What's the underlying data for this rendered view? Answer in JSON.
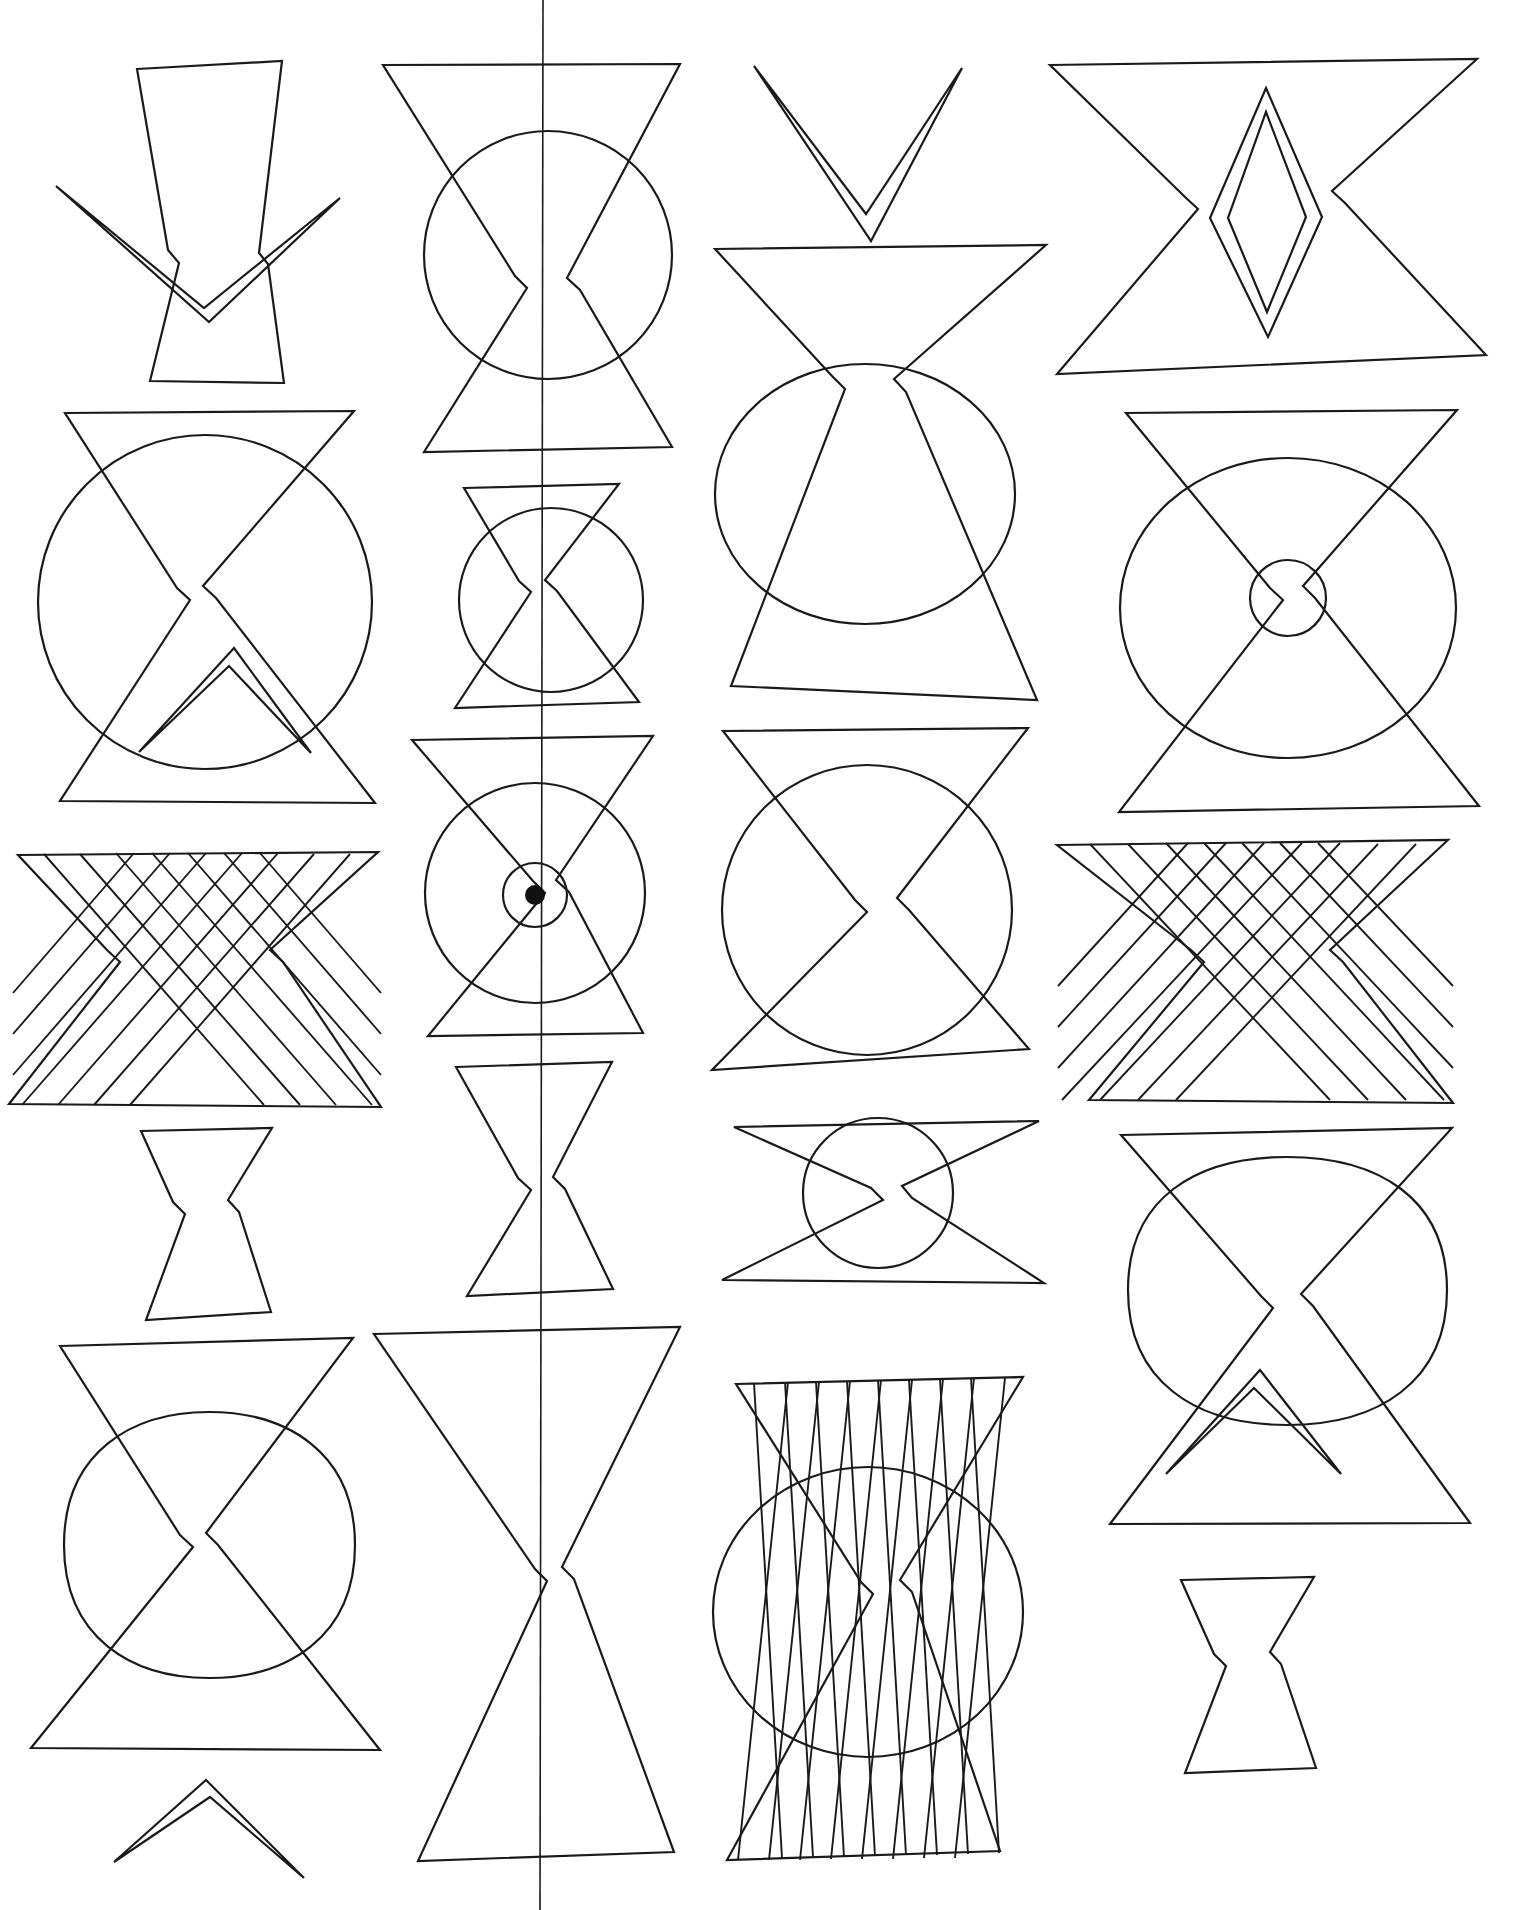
{
  "document": {
    "title": "Geometric Figure Plate",
    "kind": "line-drawing-plate",
    "background_color": "#ffffff",
    "ink_color": "#1a1a1a",
    "width": 1519,
    "height": 1910,
    "grid": {
      "columns": 4,
      "rows": 5
    },
    "has_center_fold_line": true
  },
  "fold_line": {
    "name": "center-vertical-fold",
    "x": 543,
    "y_start": 0,
    "y_end": 1910,
    "color": "#1a1a1a"
  },
  "figures": [
    {
      "id": "r1c1",
      "name": "bowtie-with-wide-chevron",
      "row": 1,
      "column": 1,
      "elements": [
        "bowtie",
        "chevron"
      ],
      "label": "Bowtie crossed by wide open chevron"
    },
    {
      "id": "r1c2",
      "name": "large-bowtie-with-circle",
      "row": 1,
      "column": 2,
      "elements": [
        "bowtie",
        "circle"
      ],
      "label": "Large bowtie overlapping a circle"
    },
    {
      "id": "r1c3a",
      "name": "narrow-chevron",
      "row": 1,
      "column": 3,
      "elements": [
        "chevron"
      ],
      "label": "Narrow V chevron"
    },
    {
      "id": "r1c3b",
      "name": "wide-bowtie-with-ellipse",
      "row": 1,
      "column": 3,
      "elements": [
        "bowtie",
        "ellipse"
      ],
      "label": "Wide bowtie overlapping an ellipse"
    },
    {
      "id": "r1c4",
      "name": "bowtie-with-lens-diamond",
      "row": 1,
      "column": 4,
      "elements": [
        "bowtie",
        "diamond-outline",
        "diamond-inner"
      ],
      "label": "Bowtie containing nested elongated diamond"
    },
    {
      "id": "r2c1",
      "name": "bowtie-circle-with-inner-triangle",
      "row": 2,
      "column": 1,
      "elements": [
        "bowtie",
        "circle",
        "triangle-spike"
      ],
      "label": "Bowtie over circle with spiked inner triangle"
    },
    {
      "id": "r2c2",
      "name": "small-bowtie-with-circle",
      "row": 2,
      "column": 2,
      "elements": [
        "bowtie",
        "circle"
      ],
      "label": "Small bowtie overlapping a circle"
    },
    {
      "id": "r2c4",
      "name": "bowtie-ellipse-with-tiny-circle",
      "row": 2,
      "column": 4,
      "elements": [
        "bowtie",
        "ellipse",
        "small-circle"
      ],
      "label": "Bowtie over ellipse with small circle at waist"
    },
    {
      "id": "r3c1",
      "name": "striped-bowtie-left",
      "row": 3,
      "column": 1,
      "elements": [
        "bowtie",
        "hatching"
      ],
      "stripe_count": 7,
      "label": "Bowtie filled with crossing diagonal stripes"
    },
    {
      "id": "r3c2",
      "name": "bowtie-with-bullseye",
      "row": 3,
      "column": 2,
      "elements": [
        "bowtie",
        "circle",
        "inner-circle",
        "center-dot"
      ],
      "label": "Bowtie with concentric bullseye and center dot"
    },
    {
      "id": "r3c3",
      "name": "bowtie-with-circle-mid",
      "row": 3,
      "column": 3,
      "elements": [
        "bowtie",
        "circle"
      ],
      "label": "Bowtie overlapping a circle"
    },
    {
      "id": "r3c4",
      "name": "striped-bowtie-right",
      "row": 3,
      "column": 4,
      "elements": [
        "bowtie",
        "hatching"
      ],
      "stripe_count": 7,
      "label": "Bowtie filled with crossing diagonal stripes"
    },
    {
      "id": "r4c1",
      "name": "small-plain-bowtie",
      "row": 4,
      "column": 1,
      "elements": [
        "bowtie"
      ],
      "label": "Small plain bowtie"
    },
    {
      "id": "r4c2",
      "name": "tall-narrow-bowtie",
      "row": 4,
      "column": 2,
      "elements": [
        "bowtie"
      ],
      "label": "Tall narrow bowtie"
    },
    {
      "id": "r4c3",
      "name": "flat-bowtie-with-circle",
      "row": 4,
      "column": 3,
      "elements": [
        "bowtie",
        "circle"
      ],
      "label": "Flat wide bowtie with circle at waist"
    },
    {
      "id": "r4c4",
      "name": "bowtie-rounded-square-spike",
      "row": 4,
      "column": 4,
      "elements": [
        "bowtie",
        "rounded-square",
        "triangle-spike"
      ],
      "label": "Bowtie over rounded square with spiked inner triangle"
    },
    {
      "id": "r5c1",
      "name": "bowtie-with-rounded-square",
      "row": 5,
      "column": 1,
      "elements": [
        "bowtie",
        "rounded-square"
      ],
      "label": "Bowtie overlapping a rounded square"
    },
    {
      "id": "r5c1b",
      "name": "small-chevron",
      "row": 5,
      "column": 1,
      "elements": [
        "chevron"
      ],
      "label": "Small chevron at page foot"
    },
    {
      "id": "r5c2",
      "name": "tall-bowtie-on-fold",
      "row": 5,
      "column": 2,
      "elements": [
        "bowtie"
      ],
      "label": "Tall bowtie straddling the fold line"
    },
    {
      "id": "r5c3",
      "name": "striped-bowtie-with-ellipse",
      "row": 5,
      "column": 3,
      "elements": [
        "bowtie",
        "hatching",
        "ellipse"
      ],
      "stripe_count": 8,
      "label": "Striped bowtie over a large ellipse"
    },
    {
      "id": "r5c4",
      "name": "small-bowtie-bottom-right",
      "row": 5,
      "column": 4,
      "elements": [
        "bowtie"
      ],
      "label": "Small bowtie at bottom right"
    }
  ]
}
